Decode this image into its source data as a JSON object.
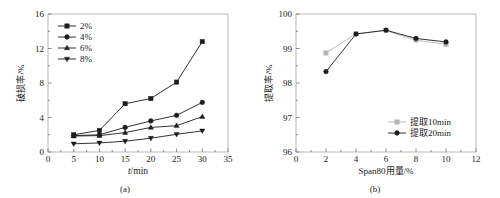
{
  "figure": {
    "panel_a_caption": "(a)",
    "panel_b_caption": "(b)"
  },
  "chart_data": [
    {
      "type": "line",
      "panel": "(a)",
      "title": "",
      "xlabel": "t/min",
      "ylabel": "破损率/%",
      "xlim": [
        0,
        35
      ],
      "ylim": [
        0,
        16
      ],
      "xticks": [
        0,
        5,
        10,
        15,
        20,
        25,
        30,
        35
      ],
      "yticks": [
        0,
        4,
        8,
        12,
        16
      ],
      "xtick_labels": [
        "0",
        "5",
        "10",
        "15",
        "20",
        "25",
        "30",
        "35"
      ],
      "ytick_labels": [
        "0",
        "4",
        "8",
        "12",
        "16"
      ],
      "grid": false,
      "legend_position": "top-left",
      "x": [
        5,
        10,
        15,
        20,
        25,
        30
      ],
      "series": [
        {
          "name": "2%",
          "marker": "square",
          "color": "#1c1c1c",
          "values": [
            2.0,
            2.5,
            5.6,
            6.2,
            8.1,
            12.8
          ]
        },
        {
          "name": "4%",
          "marker": "circle",
          "color": "#1c1c1c",
          "values": [
            1.9,
            2.0,
            2.85,
            3.6,
            4.25,
            5.75
          ]
        },
        {
          "name": "6%",
          "marker": "triangle-up",
          "color": "#1c1c1c",
          "values": [
            1.85,
            1.9,
            2.25,
            2.85,
            3.05,
            4.1
          ]
        },
        {
          "name": "8%",
          "marker": "triangle-down",
          "color": "#1c1c1c",
          "values": [
            0.95,
            1.05,
            1.25,
            1.6,
            2.05,
            2.45
          ]
        }
      ]
    },
    {
      "type": "line",
      "panel": "(b)",
      "title": "",
      "xlabel": "Span80用量/%",
      "ylabel": "提取率/%",
      "xlim": [
        0,
        12
      ],
      "ylim": [
        96,
        100
      ],
      "xticks": [
        0,
        2,
        4,
        6,
        8,
        10,
        12
      ],
      "yticks": [
        96,
        97,
        98,
        99,
        100
      ],
      "xtick_labels": [
        "0",
        "2",
        "4",
        "6",
        "8",
        "10",
        "12"
      ],
      "ytick_labels": [
        "96",
        "97",
        "98",
        "99",
        "100"
      ],
      "grid": false,
      "legend_position": "bottom-right",
      "x": [
        2,
        4,
        6,
        8,
        10
      ],
      "series": [
        {
          "name": "提取10min",
          "marker": "square",
          "color": "#b5b5b5",
          "values": [
            98.87,
            99.43,
            99.52,
            99.24,
            99.12
          ]
        },
        {
          "name": "提取20min",
          "marker": "circle",
          "color": "#1c1c1c",
          "values": [
            98.33,
            99.42,
            99.53,
            99.29,
            99.19
          ]
        }
      ]
    }
  ]
}
